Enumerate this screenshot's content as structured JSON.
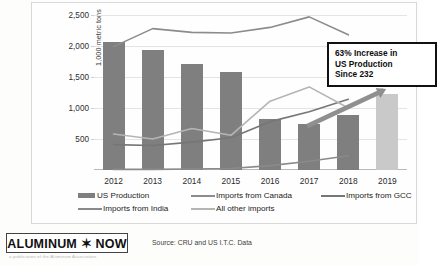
{
  "chart_data": {
    "type": "bar",
    "title": "",
    "subtitle": "",
    "xlabel": "",
    "ylabel": "1,000 metric tons",
    "categories": [
      "2012",
      "2013",
      "2014",
      "2015",
      "2016",
      "2017",
      "2018",
      "2019"
    ],
    "ylim": [
      0,
      2500
    ],
    "yticks": [
      500,
      1000,
      1500,
      2000,
      2500
    ],
    "ytick_labels": [
      "500",
      "1,000",
      "1,500",
      "2,000",
      "2,500"
    ],
    "grid": true,
    "legend_position": "bottom",
    "series": [
      {
        "name": "US Production",
        "kind": "bar",
        "color": "#7f7f7f",
        "highlight_color": "#c9c9c9",
        "highlight_category": "2019",
        "values": [
          2070,
          1940,
          1710,
          1580,
          820,
          740,
          890,
          1220
        ]
      },
      {
        "name": "Imports from Canada",
        "kind": "line",
        "color": "#8c8c8c",
        "values": [
          1990,
          2280,
          2220,
          2210,
          2300,
          2470,
          2180,
          null
        ]
      },
      {
        "name": "Imports from GCC",
        "kind": "line",
        "color": "#767676",
        "values": [
          410,
          395,
          450,
          520,
          780,
          940,
          1140,
          null
        ]
      },
      {
        "name": "Imports from India",
        "kind": "line",
        "color": "#8a8a8a",
        "values": [
          10,
          10,
          15,
          25,
          70,
          140,
          230,
          null
        ]
      },
      {
        "name": "All other imports",
        "kind": "line",
        "color": "#b5b5b5",
        "values": [
          580,
          500,
          670,
          560,
          1110,
          1340,
          1000,
          null
        ]
      }
    ],
    "annotations": [
      {
        "name": "callout",
        "lines": [
          "63% Increase in",
          "US Production",
          "Since 232"
        ]
      },
      {
        "name": "growth-arrow",
        "from_category": "2017",
        "to_category": "2019",
        "color": "#8f8f8f"
      }
    ]
  },
  "legend": {
    "row1": [
      {
        "label": "US Production",
        "marker": "block",
        "color": "#7f7f7f"
      },
      {
        "label": "Imports from Canada",
        "marker": "line",
        "color": "#8c8c8c"
      },
      {
        "label": "Imports from GCC",
        "marker": "line",
        "color": "#767676"
      }
    ],
    "row2": [
      {
        "label": "Imports from India",
        "marker": "line",
        "color": "#8a8a8a"
      },
      {
        "label": "All other imports",
        "marker": "line",
        "color": "#b5b5b5"
      }
    ]
  },
  "footer": {
    "logo_text": "ALUMINUM ✶ NOW",
    "logo_subtext": "a publication of the Aluminum Association",
    "source": "Source: CRU and US I.T.C. Data"
  }
}
